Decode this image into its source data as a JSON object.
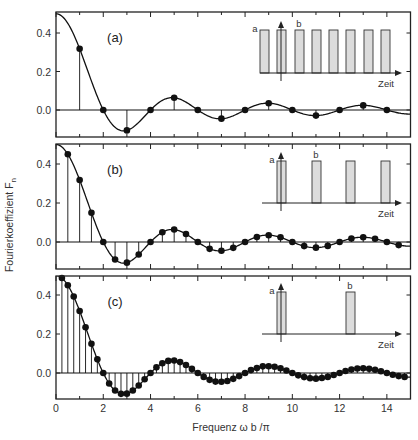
{
  "chart_data": {
    "type": "line",
    "title": "",
    "xlabel": "Frequenz ω b /π",
    "ylabel": "Fourierkoeffizient F_n",
    "ylabel_main": "Fourierkoeffizient F",
    "ylabel_sub": "n",
    "xlim": [
      0,
      15
    ],
    "ylim": [
      -0.14,
      0.51
    ],
    "x_ticks": [
      0,
      2,
      4,
      6,
      8,
      10,
      12,
      14
    ],
    "x_tick_labels": [
      "0",
      "2",
      "4",
      "6",
      "8",
      "10",
      "12",
      "14"
    ],
    "y_ticks": [
      0.0,
      0.2,
      0.4
    ],
    "y_tick_labels": [
      "0.0",
      "0.2",
      "0.4"
    ],
    "grid": false,
    "envelope": "0.5 * sin(pi*x/2) / (pi*x/2)",
    "panels": [
      {
        "label": "(a)",
        "point_spacing": 1,
        "x": [
          1,
          2,
          3,
          4,
          5,
          6,
          7,
          8,
          9,
          10,
          11,
          12,
          13,
          14
        ],
        "values": [
          0.318,
          0,
          -0.106,
          0,
          0.064,
          0,
          -0.045,
          0,
          0.035,
          0,
          -0.029,
          0,
          0.024,
          0
        ],
        "inset": {
          "pulse_count": 8,
          "label_a": "a",
          "label_b": "b",
          "axis_label": "Zeit"
        }
      },
      {
        "label": "(b)",
        "point_spacing": 0.5,
        "x": [
          0.5,
          1,
          1.5,
          2,
          2.5,
          3,
          3.5,
          4,
          4.5,
          5,
          5.5,
          6,
          6.5,
          7,
          7.5,
          8,
          8.5,
          9,
          9.5,
          10,
          10.5,
          11,
          11.5,
          12,
          12.5,
          13,
          13.5,
          14,
          14.5
        ],
        "values": [
          0.45,
          0.318,
          0.15,
          0,
          -0.09,
          -0.106,
          -0.064,
          0,
          0.05,
          0.064,
          0.041,
          0,
          -0.035,
          -0.045,
          -0.03,
          0,
          0.026,
          0.035,
          0.024,
          0,
          -0.021,
          -0.029,
          -0.02,
          0,
          0.018,
          0.024,
          0.017,
          0,
          -0.016
        ],
        "inset": {
          "pulse_count": 4,
          "label_a": "a",
          "label_b": "b",
          "axis_label": "Zeit"
        }
      },
      {
        "label": "(c)",
        "point_spacing": 0.25,
        "x": [
          0.25,
          0.5,
          0.75,
          1,
          1.25,
          1.5,
          1.75,
          2,
          2.25,
          2.5,
          2.75,
          3,
          3.25,
          3.5,
          3.75,
          4,
          4.25,
          4.5,
          4.75,
          5,
          5.25,
          5.5,
          5.75,
          6,
          6.25,
          6.5,
          6.75,
          7,
          7.25,
          7.5,
          7.75,
          8,
          8.25,
          8.5,
          8.75,
          9,
          9.25,
          9.5,
          9.75,
          10,
          10.25,
          10.5,
          10.75,
          11,
          11.25,
          11.5,
          11.75,
          12,
          12.25,
          12.5,
          12.75,
          13,
          13.25,
          13.5,
          13.75,
          14,
          14.25,
          14.5,
          14.75
        ],
        "values": [
          0.487,
          0.45,
          0.392,
          0.318,
          0.235,
          0.15,
          0.07,
          0,
          -0.054,
          -0.09,
          -0.107,
          -0.106,
          -0.09,
          -0.064,
          -0.032,
          0,
          0.029,
          0.05,
          0.062,
          0.064,
          0.056,
          0.041,
          0.021,
          0,
          -0.02,
          -0.035,
          -0.044,
          -0.045,
          -0.041,
          -0.03,
          -0.016,
          0,
          0.015,
          0.026,
          0.034,
          0.035,
          0.032,
          0.024,
          0.013,
          0,
          -0.012,
          -0.021,
          -0.027,
          -0.029,
          -0.026,
          -0.02,
          -0.01,
          0,
          0.01,
          0.018,
          0.023,
          0.024,
          0.022,
          0.017,
          0.009,
          0,
          -0.009,
          -0.016,
          -0.02
        ],
        "inset": {
          "pulse_count": 2,
          "label_a": "a",
          "label_b": "b",
          "axis_label": "Zeit"
        }
      }
    ]
  },
  "colors": {
    "line": "#111111",
    "marker": "#111111",
    "frame": "#222222",
    "pulse_fill": "#dcdcdc",
    "pulse_stroke": "#333333"
  }
}
